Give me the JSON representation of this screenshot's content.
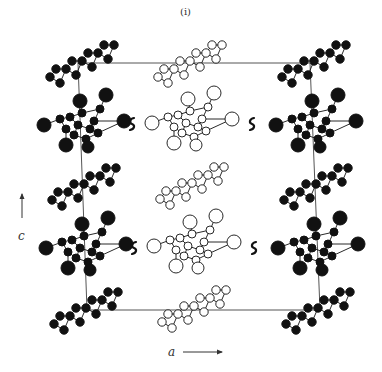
{
  "figure": {
    "panel_label": "(i)",
    "axis_labels": {
      "vertical": "c",
      "horizontal": "a"
    },
    "colors": {
      "ink": "#111111",
      "open_fill": "#ffffff",
      "cell_line": "#555555",
      "background": "#ffffff"
    },
    "unit_cell": {
      "tl": [
        78,
        63
      ],
      "tr": [
        310,
        63
      ],
      "br": [
        320,
        310
      ],
      "bl": [
        87,
        310
      ]
    },
    "axis_arrows": {
      "c": {
        "x": 22,
        "y1": 218,
        "y2": 194
      },
      "a": {
        "x1": 183,
        "x2": 222,
        "y": 352
      }
    },
    "layers": [
      {
        "row": 1,
        "y": 63,
        "orientation": "flat"
      },
      {
        "row": 2,
        "y": 123,
        "orientation": "tilted"
      },
      {
        "row": 3,
        "y": 185,
        "orientation": "flat"
      },
      {
        "row": 4,
        "y": 247,
        "orientation": "tilted"
      },
      {
        "row": 5,
        "y": 308,
        "orientation": "flat"
      }
    ],
    "molecules": [
      {
        "cx": 82,
        "cy": 63,
        "type": "flat",
        "fill": "solid"
      },
      {
        "cx": 190,
        "cy": 63,
        "type": "flat",
        "fill": "open"
      },
      {
        "cx": 314,
        "cy": 63,
        "type": "flat",
        "fill": "solid"
      },
      {
        "cx": 84,
        "cy": 125,
        "type": "tilted",
        "fill": "solid"
      },
      {
        "cx": 192,
        "cy": 123,
        "type": "tilted",
        "fill": "open"
      },
      {
        "cx": 316,
        "cy": 125,
        "type": "tilted",
        "fill": "solid"
      },
      {
        "cx": 84,
        "cy": 186,
        "type": "flat",
        "fill": "solid"
      },
      {
        "cx": 192,
        "cy": 185,
        "type": "flat",
        "fill": "open"
      },
      {
        "cx": 316,
        "cy": 186,
        "type": "flat",
        "fill": "solid"
      },
      {
        "cx": 86,
        "cy": 248,
        "type": "tilted",
        "fill": "solid"
      },
      {
        "cx": 194,
        "cy": 246,
        "type": "tilted",
        "fill": "open"
      },
      {
        "cx": 318,
        "cy": 248,
        "type": "tilted",
        "fill": "solid"
      },
      {
        "cx": 86,
        "cy": 310,
        "type": "flat",
        "fill": "solid"
      },
      {
        "cx": 194,
        "cy": 308,
        "type": "flat",
        "fill": "open"
      },
      {
        "cx": 318,
        "cy": 310,
        "type": "flat",
        "fill": "solid"
      }
    ],
    "contacts": [
      {
        "x": 132,
        "y": 124
      },
      {
        "x": 252,
        "y": 124
      },
      {
        "x": 134,
        "y": 248
      },
      {
        "x": 254,
        "y": 248
      }
    ]
  }
}
